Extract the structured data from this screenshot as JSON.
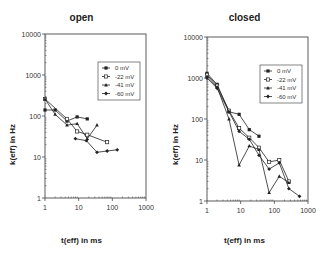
{
  "chart_data": [
    {
      "type": "line",
      "title": "open",
      "xlabel": "t(eff) in ms",
      "ylabel": "k(eff) in Hz",
      "xscale": "log",
      "yscale": "log",
      "xlim": [
        1,
        1000
      ],
      "ylim": [
        1,
        10000
      ],
      "xticks": [
        "1",
        "10",
        "100",
        "1000"
      ],
      "yticks": [
        "1",
        "10",
        "100",
        "1000",
        "10000"
      ],
      "grid": false,
      "legend_position": "upper right",
      "series": [
        {
          "name": "0 mV",
          "marker": "filled-square",
          "x": [
            1,
            2,
            4.5,
            9,
            18
          ],
          "y": [
            140,
            140,
            75,
            95,
            85
          ]
        },
        {
          "name": "-22 mV",
          "marker": "open-square",
          "x": [
            1,
            4.5,
            9,
            18,
            70
          ],
          "y": [
            260,
            85,
            42,
            35,
            23
          ]
        },
        {
          "name": "-41 mV",
          "marker": "filled-triangle",
          "x": [
            1,
            2,
            4.5,
            9,
            18,
            35
          ],
          "y": [
            260,
            110,
            60,
            65,
            28,
            60
          ]
        },
        {
          "name": "-60 mV",
          "marker": "filled-diamond",
          "x": [
            8,
            17,
            35,
            70,
            140
          ],
          "y": [
            28,
            25,
            13,
            14,
            15
          ]
        }
      ]
    },
    {
      "type": "line",
      "title": "closed",
      "xlabel": "t(eff) in ms",
      "ylabel": "k(eff) in Hz",
      "xscale": "log",
      "yscale": "log",
      "xlim": [
        1,
        1000
      ],
      "ylim": [
        1,
        10000
      ],
      "xticks": [
        "1",
        "10",
        "100",
        "1000"
      ],
      "yticks": [
        "1",
        "10",
        "100",
        "1000",
        "10000"
      ],
      "grid": false,
      "legend_position": "upper right",
      "series": [
        {
          "name": "0 mV",
          "marker": "filled-square",
          "x": [
            1,
            2,
            4.5,
            9,
            18,
            35
          ],
          "y": [
            1300,
            700,
            150,
            130,
            55,
            38
          ]
        },
        {
          "name": "-22 mV",
          "marker": "open-square",
          "x": [
            1,
            2,
            4.5,
            9,
            18,
            35,
            70,
            140,
            270
          ],
          "y": [
            1200,
            650,
            160,
            60,
            35,
            20,
            9,
            10,
            3
          ]
        },
        {
          "name": "-41 mV",
          "marker": "filled-triangle",
          "x": [
            1,
            2,
            4.5,
            9,
            18,
            35,
            70,
            140,
            270
          ],
          "y": [
            1100,
            600,
            100,
            7.5,
            22,
            18,
            1.6,
            4,
            2.8
          ]
        },
        {
          "name": "-60 mV",
          "marker": "filled-diamond",
          "x": [
            1,
            2,
            4.5,
            9,
            18,
            35,
            70,
            140,
            270,
            560
          ],
          "y": [
            1000,
            560,
            150,
            50,
            32,
            13,
            6,
            8.5,
            2,
            1.3
          ]
        }
      ]
    }
  ],
  "panels": {
    "open": {
      "title": "open",
      "xlabel": "t(eff) in ms",
      "ylabel": "k(eff) in Hz"
    },
    "closed": {
      "title": "closed",
      "xlabel": "t(eff) in ms",
      "ylabel": "k(eff) in Hz"
    }
  },
  "colors": {
    "line": "#222222",
    "axis": "#333333",
    "background": "#ffffff"
  }
}
